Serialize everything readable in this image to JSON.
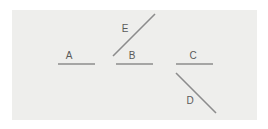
{
  "canvas": {
    "width": 268,
    "height": 129,
    "background_color": "#ffffff"
  },
  "panel": {
    "x": 12,
    "y": 10,
    "width": 245,
    "height": 110,
    "background_color": "#eeeeec"
  },
  "style": {
    "line_color": "#8c8c8c",
    "line_width": 1.6,
    "label_color": "#5a5a5a",
    "label_font_size": 10
  },
  "segments": [
    {
      "id": "segment-a",
      "label": "A",
      "orientation": "horizontal",
      "x1": 58,
      "y1": 64,
      "x2": 95,
      "y2": 64,
      "label_x": 69,
      "label_y": 59
    },
    {
      "id": "segment-b",
      "label": "B",
      "orientation": "horizontal",
      "x1": 116,
      "y1": 64,
      "x2": 153,
      "y2": 64,
      "label_x": 132,
      "label_y": 59
    },
    {
      "id": "segment-c",
      "label": "C",
      "orientation": "horizontal",
      "x1": 176,
      "y1": 64,
      "x2": 213,
      "y2": 64,
      "label_x": 193,
      "label_y": 59
    },
    {
      "id": "segment-d",
      "label": "D",
      "orientation": "diagonal-down-right",
      "x1": 176,
      "y1": 73,
      "x2": 216,
      "y2": 113,
      "label_x": 190,
      "label_y": 104
    },
    {
      "id": "segment-e",
      "label": "E",
      "orientation": "diagonal-up-right",
      "x1": 113,
      "y1": 56,
      "x2": 155,
      "y2": 14,
      "label_x": 125,
      "label_y": 32
    }
  ]
}
